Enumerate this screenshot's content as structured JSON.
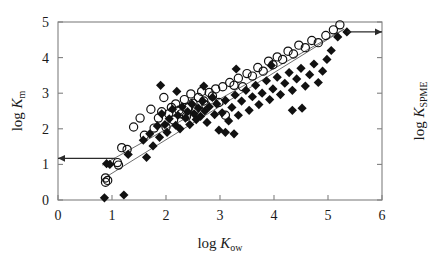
{
  "figure": {
    "background": "#ffffff",
    "frame_color": "#808080",
    "marker_color": "#111111",
    "line_color": "#6e6e6e"
  },
  "axes": {
    "x": {
      "label_prefix": "log ",
      "label_italic": "K",
      "label_sub": "ow",
      "ticks": [
        "0",
        "1",
        "2",
        "3",
        "4",
        "5",
        "6"
      ],
      "tick_values": [
        0,
        1,
        2,
        3,
        4,
        5,
        6
      ],
      "min": 0,
      "max": 6
    },
    "y_left": {
      "label_prefix": "log ",
      "label_italic": "K",
      "label_sub": "m",
      "ticks": [
        "0",
        "1",
        "2",
        "3",
        "4",
        "5"
      ],
      "tick_values": [
        0,
        1,
        2,
        3,
        4,
        5
      ],
      "min": 0,
      "max": 5
    },
    "y_right": {
      "label_prefix": "log ",
      "label_italic": "K",
      "label_sub": "SPME",
      "ticks": [
        "",
        "",
        "",
        "",
        "",
        ""
      ],
      "tick_values": [
        0,
        1,
        2,
        3,
        4,
        5
      ],
      "min": 0,
      "max": 5
    }
  },
  "annotations": [
    {
      "name": "left-axis-arrow",
      "direction": "left",
      "from_x": 1.06,
      "from_y": 1.17,
      "to_x": 0.0,
      "to_y": 1.17
    },
    {
      "name": "right-axis-arrow",
      "direction": "right",
      "from_x": 5.35,
      "from_y": 4.72,
      "to_x": 6.0,
      "to_y": 4.72
    }
  ],
  "chart_data": {
    "type": "scatter",
    "title": "",
    "xlabel": "log Kow",
    "ylabel": "log Km",
    "ylabel_right": "log KSPME",
    "xlim": [
      0,
      6
    ],
    "ylim": [
      0,
      5
    ],
    "grid": false,
    "legend": "none",
    "series": [
      {
        "name": "log Km (open circles)",
        "marker": "open-circle",
        "points": [
          [
            0.88,
            0.62
          ],
          [
            0.88,
            0.5
          ],
          [
            0.92,
            0.55
          ],
          [
            1.1,
            1.05
          ],
          [
            1.12,
            0.98
          ],
          [
            1.18,
            1.47
          ],
          [
            1.28,
            1.42
          ],
          [
            1.4,
            2.05
          ],
          [
            1.52,
            2.3
          ],
          [
            1.6,
            1.82
          ],
          [
            1.72,
            2.55
          ],
          [
            1.78,
            2.02
          ],
          [
            1.86,
            2.3
          ],
          [
            1.92,
            2.48
          ],
          [
            1.96,
            2.88
          ],
          [
            2.0,
            2.05
          ],
          [
            2.05,
            2.42
          ],
          [
            2.1,
            2.6
          ],
          [
            2.14,
            2.25
          ],
          [
            2.18,
            2.7
          ],
          [
            2.24,
            2.52
          ],
          [
            2.28,
            2.42
          ],
          [
            2.34,
            2.82
          ],
          [
            2.38,
            2.35
          ],
          [
            2.42,
            2.6
          ],
          [
            2.46,
            2.98
          ],
          [
            2.5,
            2.72
          ],
          [
            2.55,
            2.55
          ],
          [
            2.6,
            2.88
          ],
          [
            2.66,
            3.05
          ],
          [
            2.7,
            2.78
          ],
          [
            2.74,
            2.66
          ],
          [
            2.8,
            3.02
          ],
          [
            2.86,
            2.92
          ],
          [
            2.92,
            3.12
          ],
          [
            2.98,
            2.74
          ],
          [
            3.05,
            3.18
          ],
          [
            3.1,
            2.38
          ],
          [
            3.18,
            3.3
          ],
          [
            3.26,
            3.22
          ],
          [
            3.34,
            3.42
          ],
          [
            3.42,
            3.18
          ],
          [
            3.5,
            3.55
          ],
          [
            3.6,
            3.48
          ],
          [
            3.7,
            3.72
          ],
          [
            3.8,
            3.62
          ],
          [
            3.9,
            3.9
          ],
          [
            3.98,
            3.8
          ],
          [
            4.06,
            4.02
          ],
          [
            4.16,
            3.95
          ],
          [
            4.26,
            4.18
          ],
          [
            4.36,
            4.1
          ],
          [
            4.46,
            4.35
          ],
          [
            4.58,
            4.28
          ],
          [
            4.7,
            4.48
          ],
          [
            4.82,
            4.42
          ],
          [
            4.96,
            4.62
          ],
          [
            5.1,
            4.78
          ],
          [
            5.22,
            4.92
          ]
        ]
      },
      {
        "name": "log KSPME (filled diamonds)",
        "marker": "filled-diamond",
        "points": [
          [
            0.86,
            0.06
          ],
          [
            1.22,
            0.14
          ],
          [
            0.9,
            1.02
          ],
          [
            0.96,
            1.0
          ],
          [
            1.3,
            1.28
          ],
          [
            1.58,
            1.68
          ],
          [
            1.64,
            1.2
          ],
          [
            1.7,
            1.86
          ],
          [
            1.76,
            1.52
          ],
          [
            1.84,
            2.08
          ],
          [
            1.88,
            1.76
          ],
          [
            1.92,
            2.42
          ],
          [
            1.98,
            2.12
          ],
          [
            2.02,
            1.9
          ],
          [
            2.06,
            2.28
          ],
          [
            2.12,
            2.55
          ],
          [
            2.18,
            2.1
          ],
          [
            2.22,
            2.38
          ],
          [
            2.26,
            2.0
          ],
          [
            2.3,
            2.62
          ],
          [
            2.36,
            2.3
          ],
          [
            2.4,
            2.48
          ],
          [
            2.44,
            2.12
          ],
          [
            2.48,
            2.7
          ],
          [
            2.52,
            2.42
          ],
          [
            2.56,
            2.26
          ],
          [
            2.6,
            2.58
          ],
          [
            2.64,
            2.35
          ],
          [
            2.68,
            2.78
          ],
          [
            2.72,
            2.5
          ],
          [
            2.76,
            2.18
          ],
          [
            2.8,
            2.62
          ],
          [
            2.86,
            2.88
          ],
          [
            2.9,
            2.4
          ],
          [
            2.94,
            2.7
          ],
          [
            2.98,
            1.96
          ],
          [
            3.04,
            2.45
          ],
          [
            3.1,
            2.8
          ],
          [
            3.16,
            2.22
          ],
          [
            3.22,
            2.6
          ],
          [
            3.28,
            2.95
          ],
          [
            3.34,
            2.38
          ],
          [
            3.4,
            2.78
          ],
          [
            3.48,
            3.08
          ],
          [
            3.54,
            2.52
          ],
          [
            3.6,
            2.9
          ],
          [
            3.66,
            3.22
          ],
          [
            3.72,
            2.68
          ],
          [
            3.78,
            3.0
          ],
          [
            3.86,
            3.35
          ],
          [
            3.92,
            2.82
          ],
          [
            3.98,
            3.12
          ],
          [
            4.06,
            3.45
          ],
          [
            4.12,
            2.96
          ],
          [
            4.2,
            3.28
          ],
          [
            4.28,
            3.58
          ],
          [
            4.34,
            3.08
          ],
          [
            4.42,
            3.4
          ],
          [
            4.5,
            3.7
          ],
          [
            4.58,
            3.2
          ],
          [
            4.66,
            3.52
          ],
          [
            4.74,
            3.82
          ],
          [
            4.82,
            3.3
          ],
          [
            4.9,
            3.62
          ],
          [
            4.98,
            3.95
          ],
          [
            5.06,
            4.2
          ],
          [
            5.18,
            4.58
          ],
          [
            5.35,
            4.72
          ],
          [
            1.9,
            3.22
          ],
          [
            2.2,
            3.05
          ],
          [
            2.7,
            3.2
          ],
          [
            3.3,
            3.68
          ],
          [
            3.95,
            3.78
          ],
          [
            4.34,
            2.52
          ],
          [
            4.52,
            2.58
          ],
          [
            3.1,
            1.9
          ],
          [
            3.26,
            1.86
          ]
        ]
      }
    ],
    "fit_lines": [
      {
        "name": "upper-regression-line",
        "x1": 0.82,
        "y1": 0.98,
        "x2": 5.3,
        "y2": 4.8
      },
      {
        "name": "lower-regression-line",
        "x1": 0.86,
        "y1": 0.62,
        "x2": 5.28,
        "y2": 4.78
      }
    ]
  }
}
